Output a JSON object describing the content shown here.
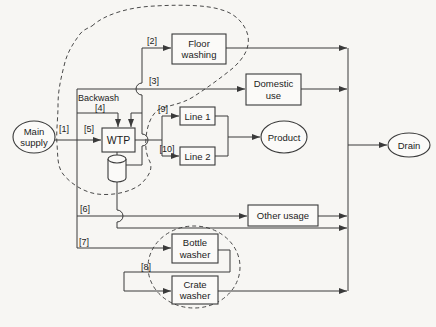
{
  "colors": {
    "background": "#f7f6f3",
    "line": "#3a3a3a",
    "text": "#1c1c1c"
  },
  "diagram": {
    "nodes": {
      "main_supply": {
        "line1": "Main",
        "line2": "supply"
      },
      "wtp": {
        "label": "WTP"
      },
      "floor_washing": {
        "line1": "Floor",
        "line2": "washing"
      },
      "domestic_use": {
        "line1": "Domestic",
        "line2": "use"
      },
      "line_1": {
        "label": "Line 1"
      },
      "line_2": {
        "label": "Line 2"
      },
      "product": {
        "label": "Product"
      },
      "other_usage": {
        "label": "Other usage"
      },
      "bottle_washer": {
        "line1": "Bottle",
        "line2": "washer"
      },
      "crate_washer": {
        "line1": "Crate",
        "line2": "washer"
      },
      "drain": {
        "label": "Drain"
      }
    },
    "streams": {
      "s1": "[1]",
      "s2": "[2]",
      "s3": "[3]",
      "s4": "[4]",
      "s5": "[5]",
      "s6": "[6]",
      "s7": "[7]",
      "s8": "[8]",
      "s9": "[9]",
      "s10": "[10]",
      "backwash": "Backwash"
    }
  }
}
